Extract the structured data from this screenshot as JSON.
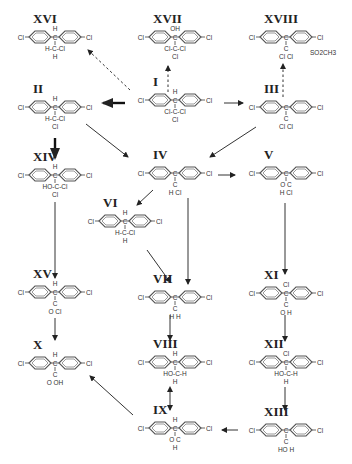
{
  "diagram": {
    "title": "",
    "compounds": [
      {
        "id": "I",
        "label": "I",
        "x": 175,
        "y": 100,
        "substituents": {
          "top": "H",
          "bottom": "Cl-C-Cl",
          "bottom2": "Cl"
        }
      },
      {
        "id": "II",
        "label": "II",
        "x": 55,
        "y": 107,
        "substituents": {
          "top": "H",
          "bottom": "H-C-Cl",
          "bottom2": "Cl"
        }
      },
      {
        "id": "III",
        "label": "III",
        "x": 286,
        "y": 107,
        "substituents": {
          "top": "",
          "bottom": "C",
          "bottom2": "Cl  Cl"
        }
      },
      {
        "id": "IV",
        "label": "IV",
        "x": 175,
        "y": 173,
        "substituents": {
          "top": "",
          "bottom": "C",
          "bottom2": "H  Cl"
        }
      },
      {
        "id": "V",
        "label": "V",
        "x": 286,
        "y": 173,
        "substituents": {
          "top": "",
          "bottom": "O  C",
          "bottom2": "H  Cl"
        }
      },
      {
        "id": "VI",
        "label": "VI",
        "x": 125,
        "y": 221,
        "substituents": {
          "top": "H",
          "bottom": "H-C-Cl",
          "bottom2": "H"
        }
      },
      {
        "id": "VII",
        "label": "VII",
        "x": 175,
        "y": 297,
        "substituents": {
          "top": "",
          "bottom": "C",
          "bottom2": "H  H"
        }
      },
      {
        "id": "VIII",
        "label": "VIII",
        "x": 175,
        "y": 362,
        "substituents": {
          "top": "H",
          "bottom": "HO-C-H",
          "bottom2": "H"
        }
      },
      {
        "id": "IX",
        "label": "IX",
        "x": 175,
        "y": 428,
        "substituents": {
          "top": "H",
          "bottom": "O  C",
          "bottom2": "H"
        }
      },
      {
        "id": "X",
        "label": "X",
        "x": 55,
        "y": 363,
        "substituents": {
          "top": "H",
          "bottom": "C",
          "bottom2": "O  OH"
        }
      },
      {
        "id": "XI",
        "label": "XI",
        "x": 286,
        "y": 293,
        "substituents": {
          "top": "Cl",
          "bottom": "C",
          "bottom2": "O  H"
        }
      },
      {
        "id": "XII",
        "label": "XII",
        "x": 286,
        "y": 362,
        "substituents": {
          "top": "Cl",
          "bottom": "HO-C-H",
          "bottom2": "H"
        }
      },
      {
        "id": "XIII",
        "label": "XIII",
        "x": 286,
        "y": 430,
        "substituents": {
          "top": "",
          "bottom": "C",
          "bottom2": "HO  H"
        }
      },
      {
        "id": "XIV",
        "label": "XIV",
        "x": 55,
        "y": 175,
        "substituents": {
          "top": "H",
          "bottom": "HO-C-Cl",
          "bottom2": "Cl"
        }
      },
      {
        "id": "XV",
        "label": "XV",
        "x": 55,
        "y": 292,
        "substituents": {
          "top": "H",
          "bottom": "C",
          "bottom2": "O  Cl"
        }
      },
      {
        "id": "XVI",
        "label": "XVI",
        "x": 55,
        "y": 37,
        "substituents": {
          "top": "H",
          "bottom": "H-C-Cl",
          "bottom2": "H"
        }
      },
      {
        "id": "XVII",
        "label": "XVII",
        "x": 175,
        "y": 37,
        "substituents": {
          "top": "OH",
          "bottom": "Cl-C-Cl",
          "bottom2": "Cl"
        }
      },
      {
        "id": "XVIII",
        "label": "XVIII",
        "x": 286,
        "y": 37,
        "substituents": {
          "top": "",
          "bottom": "C",
          "bottom2": "Cl  Cl",
          "extra": "SO2CH3"
        }
      }
    ],
    "atom_labels": {
      "chlorine": "Cl",
      "hydrogen": "H",
      "carbon": "C",
      "oxygen": "O",
      "hydroxyl": "OH",
      "hydroxyl_left": "HO",
      "methylsulfonyl": "SO2CH3"
    },
    "arrows": [
      {
        "from": "I",
        "to": "II",
        "style": "bold"
      },
      {
        "from": "I",
        "to": "III",
        "style": "solid"
      },
      {
        "from": "I",
        "to": "XVI",
        "style": "dashed"
      },
      {
        "from": "I",
        "to": "XVII",
        "style": "dashed"
      },
      {
        "from": "III",
        "to": "XVIII",
        "style": "dashed"
      },
      {
        "from": "II",
        "to": "XIV",
        "style": "bold"
      },
      {
        "from": "II",
        "to": "IV",
        "style": "solid"
      },
      {
        "from": "III",
        "to": "IV",
        "style": "solid"
      },
      {
        "from": "IV",
        "to": "V",
        "style": "solid"
      },
      {
        "from": "IV",
        "to": "VI",
        "style": "solid"
      },
      {
        "from": "IV",
        "to": "VII",
        "style": "solid"
      },
      {
        "from": "VI",
        "to": "VII",
        "style": "solid"
      },
      {
        "from": "XIV",
        "to": "XV",
        "style": "solid"
      },
      {
        "from": "XV",
        "to": "X",
        "style": "solid"
      },
      {
        "from": "VII",
        "to": "VIII",
        "style": "solid"
      },
      {
        "from": "VIII",
        "to": "IX",
        "style": "double"
      },
      {
        "from": "IX",
        "to": "X",
        "style": "solid"
      },
      {
        "from": "V",
        "to": "XI",
        "style": "solid"
      },
      {
        "from": "XI",
        "to": "XII",
        "style": "solid"
      },
      {
        "from": "XII",
        "to": "XIII",
        "style": "solid"
      },
      {
        "from": "XIII",
        "to": "IX",
        "style": "solid"
      }
    ]
  }
}
